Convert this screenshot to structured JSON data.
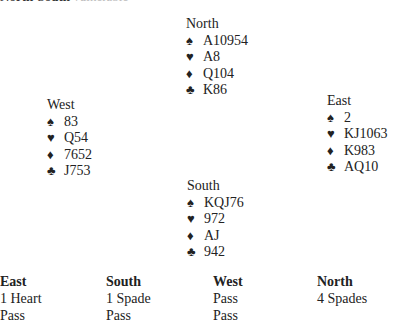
{
  "header_clipped": {
    "dark": "North-South  ",
    "light": "vulnerable"
  },
  "hands": {
    "north": {
      "label": "North",
      "spades": "A10954",
      "hearts": "A8",
      "diamonds": "Q104",
      "clubs": "K86"
    },
    "west": {
      "label": "West",
      "spades": "83",
      "hearts": "Q54",
      "diamonds": "7652",
      "clubs": "J753"
    },
    "east": {
      "label": "East",
      "spades": "2",
      "hearts": "KJ1063",
      "diamonds": "K983",
      "clubs": "AQ10"
    },
    "south": {
      "label": "South",
      "spades": "KQJ76",
      "hearts": "972",
      "diamonds": "AJ",
      "clubs": "942"
    }
  },
  "suit_icons": {
    "spades": "♠",
    "hearts": "♥",
    "diamonds": "♦",
    "clubs": "♣"
  },
  "auction": {
    "columns": [
      {
        "header": "East",
        "bids": [
          "1 Heart",
          "Pass"
        ]
      },
      {
        "header": "South",
        "bids": [
          "1 Spade",
          "Pass"
        ]
      },
      {
        "header": "West",
        "bids": [
          "Pass",
          "Pass"
        ]
      },
      {
        "header": "North",
        "bids": [
          "4 Spades"
        ]
      }
    ]
  }
}
